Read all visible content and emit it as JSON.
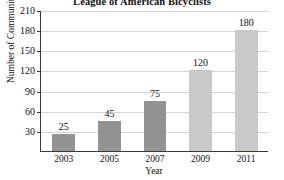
{
  "chart_data": {
    "type": "bar",
    "title": "League of American Bicyclists",
    "xlabel": "Year",
    "ylabel": "Number of Communities",
    "categories": [
      "2003",
      "2005",
      "2007",
      "2009",
      "2011"
    ],
    "values": [
      25,
      45,
      75,
      120,
      180
    ],
    "value_labels": [
      "25",
      "45",
      "75",
      "120",
      "180"
    ],
    "bar_colors": [
      "#939393",
      "#939393",
      "#939393",
      "#c9c9c9",
      "#c9c9c9"
    ],
    "ylim": [
      0,
      210
    ],
    "yticks": [
      30,
      60,
      90,
      120,
      150,
      180,
      210
    ],
    "ytick_labels": [
      "30",
      "60",
      "90",
      "120",
      "150",
      "180",
      "210"
    ],
    "grid": true,
    "grid_axis": "y",
    "legend": null,
    "legend_position": "none",
    "axis_color": "#3a3a3a",
    "gridline_color": "#d4d4d4",
    "background_color": "#ffffff"
  }
}
